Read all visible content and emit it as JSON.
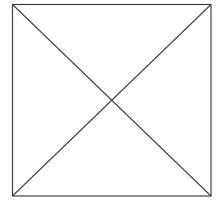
{
  "figure": {
    "kind": "image-placeholder",
    "shape": "square-with-diagonal-cross",
    "box": {
      "x1": 12,
      "y1": 4,
      "x2": 211,
      "y2": 196
    },
    "stroke_color": "#404040",
    "background_color": "#ffffff",
    "stroke_width": 1.2
  }
}
